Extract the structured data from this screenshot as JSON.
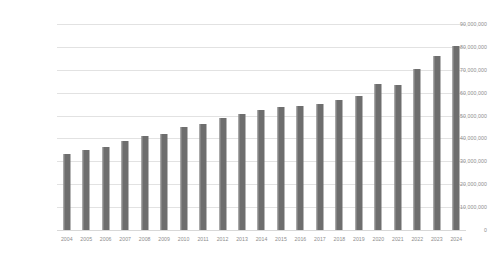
{
  "chart_data": {
    "type": "bar",
    "title": "",
    "subtitle": "",
    "xlabel": "",
    "ylabel": "",
    "grid": true,
    "legend": false,
    "legend_position": "none",
    "bar_color": "#6e6e6e",
    "gridline_color": "#e2e2e2",
    "tick_label_color": "#8d8d8d",
    "background_color": "#ffffff",
    "ylim": [
      0,
      90000000
    ],
    "ytick_step": 10000000,
    "ytick_labels": [
      "90,000,000",
      "80,000,000",
      "70,000,000",
      "60,000,000",
      "50,000,000",
      "40,000,000",
      "30,000,000",
      "20,000,000",
      "10,000,000",
      "0"
    ],
    "ytick_values": [
      90000000,
      80000000,
      70000000,
      60000000,
      50000000,
      40000000,
      30000000,
      20000000,
      10000000,
      0
    ],
    "categories": [
      "2004",
      "2005",
      "2006",
      "2007",
      "2008",
      "2009",
      "2010",
      "2011",
      "2012",
      "2013",
      "2014",
      "2015",
      "2016",
      "2017",
      "2018",
      "2019",
      "2020",
      "2021",
      "2022",
      "2023",
      "2024"
    ],
    "values": [
      33200000,
      34800000,
      36400000,
      38700000,
      41000000,
      42100000,
      44800000,
      46500000,
      48900000,
      50700000,
      52400000,
      53900000,
      54300000,
      55100000,
      56800000,
      58500000,
      63600000,
      63300000,
      70500000,
      76000000,
      80200000
    ]
  }
}
